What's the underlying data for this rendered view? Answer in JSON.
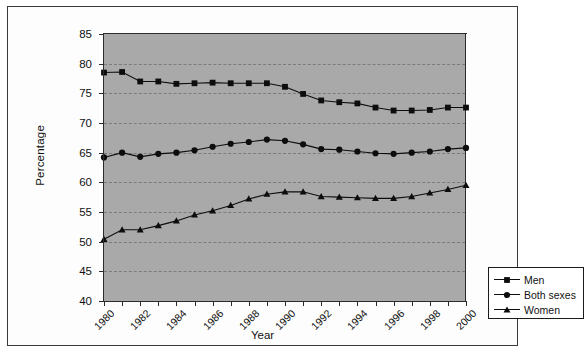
{
  "chart_data": {
    "type": "line",
    "title": "",
    "xlabel": "Year",
    "ylabel": "Percentage",
    "xlim": [
      1980,
      2000
    ],
    "ylim": [
      40,
      85
    ],
    "ytick_step": 5,
    "yticks": [
      40,
      45,
      50,
      55,
      60,
      65,
      70,
      75,
      80,
      85
    ],
    "xticks": [
      1980,
      1982,
      1984,
      1986,
      1988,
      1990,
      1992,
      1994,
      1996,
      1998,
      2000
    ],
    "xtick_labels": [
      "1980",
      "1982",
      "1984",
      "1986",
      "1988",
      "1990",
      "1992",
      "1994",
      "1996",
      "1998",
      "2000"
    ],
    "ytick_labels": [
      "40",
      "45",
      "50",
      "55",
      "60",
      "65",
      "70",
      "75",
      "80",
      "85"
    ],
    "grid": "horizontal-dashed",
    "plot_background": "#a9a9a9",
    "legend_position": "lower-right",
    "x": [
      1980,
      1981,
      1982,
      1983,
      1984,
      1985,
      1986,
      1987,
      1988,
      1989,
      1990,
      1991,
      1992,
      1993,
      1994,
      1995,
      1996,
      1997,
      1998,
      1999,
      2000
    ],
    "series": [
      {
        "name": "Men",
        "marker": "square",
        "color": "#0d0d0d",
        "values": [
          78.5,
          78.6,
          77.0,
          77.0,
          76.6,
          76.7,
          76.8,
          76.7,
          76.7,
          76.7,
          76.1,
          74.9,
          73.8,
          73.5,
          73.3,
          72.6,
          72.1,
          72.1,
          72.2,
          72.6,
          72.6
        ]
      },
      {
        "name": "Both sexes",
        "marker": "circle",
        "color": "#0d0d0d",
        "values": [
          64.2,
          65.0,
          64.3,
          64.8,
          65.0,
          65.4,
          66.0,
          66.5,
          66.8,
          67.2,
          67.0,
          66.4,
          65.6,
          65.5,
          65.2,
          64.9,
          64.8,
          65.0,
          65.2,
          65.6,
          65.8
        ]
      },
      {
        "name": "Women",
        "marker": "triangle",
        "color": "#0d0d0d",
        "values": [
          50.4,
          52.0,
          52.0,
          52.7,
          53.5,
          54.5,
          55.2,
          56.1,
          57.2,
          58.0,
          58.4,
          58.4,
          57.6,
          57.5,
          57.4,
          57.3,
          57.3,
          57.6,
          58.2,
          58.8,
          59.5
        ]
      }
    ]
  },
  "legend": {
    "items": [
      {
        "label": "Men"
      },
      {
        "label": "Both sexes"
      },
      {
        "label": "Women"
      }
    ]
  },
  "axes": {
    "y_title": "Percentage",
    "x_title": "Year"
  }
}
